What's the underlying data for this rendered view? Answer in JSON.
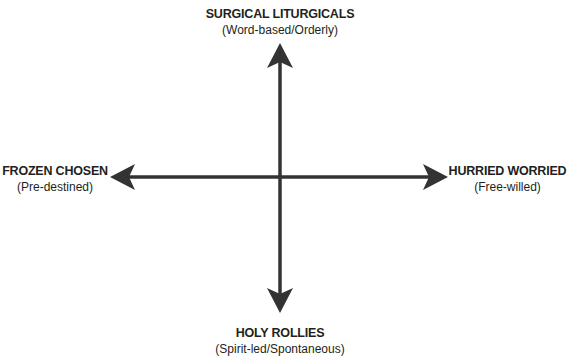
{
  "diagram": {
    "type": "quadrant-axes",
    "axes": {
      "vertical": {
        "top": {
          "title": "SURGICAL LITURGICALS",
          "subtitle": "(Word-based/Orderly)"
        },
        "bottom": {
          "title": "HOLY ROLLIES",
          "subtitle": "(Spirit-led/Spontaneous)"
        }
      },
      "horizontal": {
        "left": {
          "title": "FROZEN CHOSEN",
          "subtitle": "(Pre-destined)"
        },
        "right": {
          "title": "HURRIED WORRIED",
          "subtitle": "(Free-willed)"
        }
      }
    },
    "colors": {
      "arrow": "#333333",
      "text": "#231f20",
      "background": "#ffffff"
    }
  }
}
